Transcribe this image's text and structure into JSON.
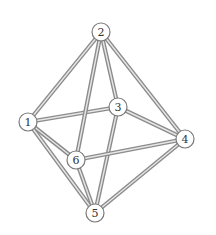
{
  "diagram": {
    "type": "octahedron-graph",
    "colors": {
      "edge_outline": "#8c8c8c",
      "edge_highlight": "#e6e6e6",
      "node_stroke": "#7a7a7a",
      "node_fill": "#ffffff",
      "label": "#333333"
    },
    "node_radius": 9,
    "nodes": [
      {
        "id": "1",
        "label": "1",
        "x": 28,
        "y": 122
      },
      {
        "id": "2",
        "label": "2",
        "x": 101,
        "y": 32
      },
      {
        "id": "3",
        "label": "3",
        "x": 118,
        "y": 107
      },
      {
        "id": "4",
        "label": "4",
        "x": 185,
        "y": 139
      },
      {
        "id": "5",
        "label": "5",
        "x": 95,
        "y": 213
      },
      {
        "id": "6",
        "label": "6",
        "x": 76,
        "y": 160
      }
    ],
    "edges": [
      [
        "1",
        "2"
      ],
      [
        "1",
        "3"
      ],
      [
        "1",
        "6"
      ],
      [
        "1",
        "5"
      ],
      [
        "2",
        "3"
      ],
      [
        "2",
        "4"
      ],
      [
        "2",
        "6"
      ],
      [
        "3",
        "4"
      ],
      [
        "3",
        "5"
      ],
      [
        "6",
        "4"
      ],
      [
        "6",
        "5"
      ],
      [
        "4",
        "5"
      ]
    ]
  }
}
